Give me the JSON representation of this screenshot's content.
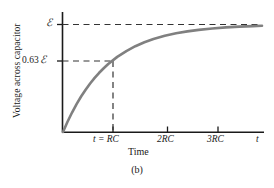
{
  "figure": {
    "caption": "(b)",
    "background_color": "#ffffff",
    "axis_color": "#1a1a1a",
    "curve_color": "#808080",
    "dash_color": "#333333"
  },
  "chart_data": {
    "type": "line",
    "title": "",
    "subtitle": "",
    "xlabel": "Time",
    "ylabel": "Voltage across capacitor",
    "grid": false,
    "legend": null,
    "x_tick_labels": [
      "t = RC",
      "2RC",
      "3RC",
      "t"
    ],
    "x_tick_values": [
      1,
      2,
      3,
      4.15
    ],
    "y_tick_labels": [
      "0.63 ℰ",
      "ℰ"
    ],
    "y_tick_values": [
      0.63,
      1.0
    ],
    "xlim": [
      0,
      4.4
    ],
    "ylim": [
      0,
      1.12
    ],
    "equation": "V = ℰ (1 - e^(-t/RC))",
    "series": [
      {
        "name": "Voltage across capacitor",
        "x": [
          0.0,
          0.1,
          0.2,
          0.3,
          0.4,
          0.5,
          0.6,
          0.7,
          0.8,
          0.9,
          1.0,
          1.2,
          1.4,
          1.6,
          1.8,
          2.0,
          2.25,
          2.5,
          2.75,
          3.0,
          3.3,
          3.6,
          3.9,
          4.2,
          4.4
        ],
        "y": [
          0.0,
          0.095,
          0.181,
          0.259,
          0.33,
          0.393,
          0.451,
          0.503,
          0.551,
          0.593,
          0.632,
          0.699,
          0.753,
          0.798,
          0.835,
          0.865,
          0.895,
          0.918,
          0.936,
          0.95,
          0.963,
          0.973,
          0.98,
          0.985,
          0.988
        ]
      }
    ],
    "annotations": [
      {
        "name": "asymptote-emf",
        "label": "ℰ",
        "type": "horizontal-dashed-line",
        "y": 1.0
      },
      {
        "name": "marker-063-emf-horizontal",
        "label": "0.63 ℰ",
        "type": "horizontal-dashed-line",
        "y": 0.63,
        "x_end": 1.0
      },
      {
        "name": "marker-rc-vertical",
        "label": "t = RC",
        "type": "vertical-dashed-line",
        "x": 1.0,
        "y_end": 0.63
      }
    ]
  },
  "labels": {
    "y_axis_title": "Voltage across capacitor",
    "x_axis_title": "Time",
    "emf_symbol": "ℰ",
    "value_063_prefix": "0.63",
    "tick_rc": "t = RC",
    "tick_2rc": "2RC",
    "tick_3rc": "3RC",
    "tick_t": "t",
    "caption": "(b)"
  }
}
